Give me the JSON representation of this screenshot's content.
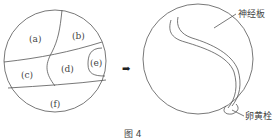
{
  "figure": {
    "caption": "图 4",
    "left_diagram": {
      "regions": [
        {
          "id": "a",
          "label": "(a)"
        },
        {
          "id": "b",
          "label": "(b)"
        },
        {
          "id": "c",
          "label": "(c)"
        },
        {
          "id": "d",
          "label": "(d)"
        },
        {
          "id": "e",
          "label": "(e)"
        },
        {
          "id": "f",
          "label": "(f)"
        }
      ]
    },
    "arrow": {
      "icon": "right-arrow-icon",
      "glyph": "➡"
    },
    "right_diagram": {
      "annotations": [
        {
          "id": "neural-plate",
          "label": "神经板"
        },
        {
          "id": "yolk-plug",
          "label": "卵黄栓"
        }
      ]
    },
    "colors": {
      "line": "#555555",
      "text": "#444444",
      "background": "#ffffff"
    }
  }
}
